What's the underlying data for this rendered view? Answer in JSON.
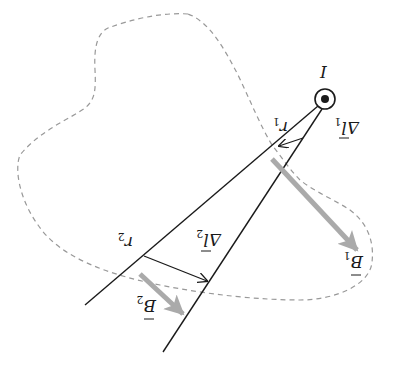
{
  "figure": {
    "current": {
      "label": "I",
      "symbol": "out-of-page (dot in circle)"
    },
    "labels": {
      "r1": "r",
      "r1_sub": "1",
      "r2": "r",
      "r2_sub": "2",
      "dl1": "Δl",
      "dl1_sub": "1",
      "dl2": "Δl",
      "dl2_sub": "2",
      "b1": "B",
      "b1_sub": "1",
      "b2": "B",
      "b2_sub": "2"
    },
    "colors": {
      "line": "#1a1a1a",
      "field_arrow": "#aaaaaa",
      "loop_dashed": "#999999",
      "background": "#ffffff"
    }
  }
}
